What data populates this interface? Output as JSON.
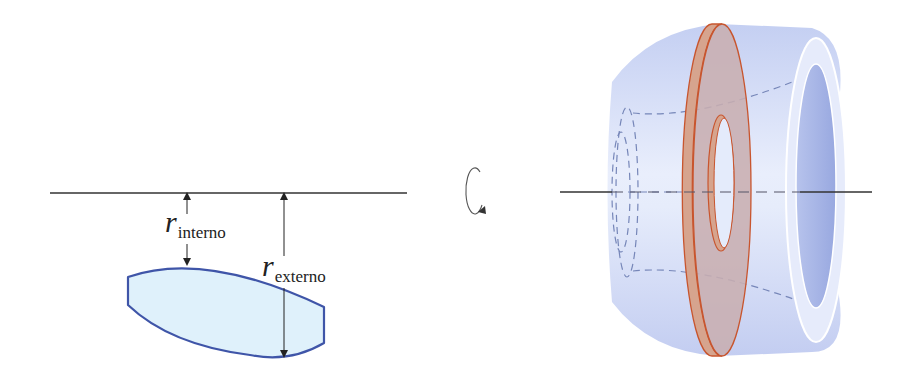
{
  "figure": {
    "width": 912,
    "height": 388,
    "background": "#ffffff"
  },
  "left_panel": {
    "axis": {
      "x1": 50,
      "x2": 407,
      "y": 193,
      "color": "#333333"
    },
    "region": {
      "fill": "#dff1fb",
      "stroke": "#3f55a8",
      "path": "M128,277 Q205,250 324,307 L324,343 Q290,363 250,355 Q170,345 128,305 Z"
    },
    "inner_radius": {
      "x": 187,
      "y_top": 193,
      "y_bottom": 265,
      "label_symbol": "r",
      "label_subscript": "interno",
      "label_x": 165,
      "label_y": 232
    },
    "outer_radius": {
      "x": 284,
      "y_top": 193,
      "y_bottom": 357,
      "label_symbol": "r",
      "label_subscript": "externo",
      "label_x": 262,
      "label_y": 276
    }
  },
  "rotation_symbol": {
    "icon": "rotation-arrow-icon",
    "cx": 476,
    "cy": 189,
    "rx": 10,
    "ry": 24,
    "color": "#555555"
  },
  "right_panel": {
    "axis": {
      "x1": 560,
      "x2": 872,
      "y": 192,
      "color": "#333333"
    },
    "solid": {
      "body_fill": "#c9d3f3",
      "body_highlight": "#e8eefc",
      "end_ring_fill": "#e6ebfb",
      "end_hole_fill": "#a9b6e6",
      "hidden_line_color": "#7686b8"
    },
    "washer": {
      "fill": "#c9a9a6",
      "rim_fill": "#d4a08a",
      "stroke": "#c8552e",
      "hole_fill": "#e4ebfb"
    }
  }
}
